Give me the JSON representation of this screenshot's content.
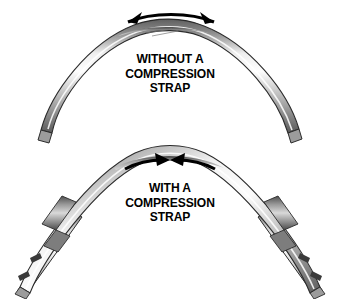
{
  "figure": {
    "background_color": "#ffffff"
  },
  "panels": [
    {
      "id": "without-strap",
      "caption_lines": [
        "WITHOUT A",
        "COMPRESSION",
        "STRAP"
      ],
      "arrow": {
        "name": "spreading-arrow",
        "direction": "outward",
        "heads": 2,
        "description": "Double-headed curved arrow above the arch apex pointing outward, indicating the arch legs spreading apart"
      },
      "members": [
        {
          "name": "arch-tube",
          "description": "Single curved metallic arch tube, legs splayed, no tie member"
        }
      ]
    },
    {
      "id": "with-strap",
      "caption_lines": [
        "WITH A",
        "COMPRESSION",
        "STRAP"
      ],
      "arrow": {
        "name": "compression-arrow",
        "direction": "inward",
        "heads": 2,
        "description": "Two curved arrows above the arch apex pointing inward toward each other, indicating compression holding the arch together"
      },
      "members": [
        {
          "name": "arch-tube",
          "description": "Curved metallic arch tube"
        },
        {
          "name": "compression-strap",
          "description": "Straight strap member running parallel beneath each arch leg"
        },
        {
          "name": "strap-clamp",
          "description": "Connector fittings joining the strap to the arch leg"
        }
      ]
    }
  ],
  "colors": {
    "metal_light": "#f2f2f2",
    "metal_mid": "#b9b9b9",
    "metal_dark": "#6e6e6e",
    "outline": "#2b2b2b",
    "arrow": "#000000",
    "text": "#000000"
  }
}
